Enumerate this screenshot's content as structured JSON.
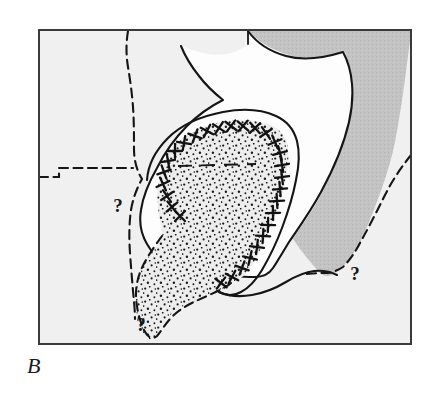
{
  "figure": {
    "panel_label": "B",
    "type": "geologic-sketch-map",
    "canvas": {
      "width": 439,
      "height": 400
    }
  },
  "frame": {
    "x": 38,
    "y": 29,
    "width": 374,
    "height": 316,
    "border_color": "#3a3a3a",
    "border_width": 2
  },
  "colors": {
    "page_background": "#ffffff",
    "map_background": "#f0f0f0",
    "craton_fill": "#fdfdfd",
    "shaded_belt_fill": "#c3c3c3",
    "stipple_inner_fill": "#ededed",
    "stipple_dot_color": "#1c1c1c",
    "line_color": "#151515",
    "label_color": "#1a1a1a"
  },
  "annotations": {
    "question_marks": [
      {
        "id": "qmark-west",
        "label": "?",
        "x": 118,
        "y": 206
      },
      {
        "id": "qmark-east",
        "label": "?",
        "x": 355,
        "y": 274
      },
      {
        "id": "qmark-south",
        "label": "?",
        "x": 141,
        "y": 325
      }
    ]
  },
  "legend_symbols": {
    "cross_chain": "x-symbol-chain",
    "stipple": "stippled-fill",
    "solid_contour": "solid-boundary-line",
    "dashed_contour": "dashed-inferred-boundary",
    "gray_shading": "gray-shaded-zone"
  },
  "geometry": {
    "shaded_zone_outline": "M 248 31 L 411 31 L 411 33 C 405 70 400 110 394 140 C 388 170 376 200 366 225 C 356 250 344 264 334 272 C 330 276 324 276 320 272 C 310 262 300 250 292 238 C 300 225 312 210 322 190 C 334 168 342 145 348 120 C 354 95 352 70 344 52 C 330 56 310 60 292 56 C 272 51 258 42 248 31 Z",
    "craton_outline": "M 248 31 C 256 42 268 51 286 56 C 304 61 326 57 342 52 C 352 70 354 96 348 122 C 342 148 332 170 320 192 C 308 214 296 230 288 242 C 282 252 276 262 272 268 C 268 274 262 277 254 277 C 244 277 234 276 226 276 C 218 276 212 279 206 284 C 198 290 192 292 186 290 C 180 288 174 282 168 274 C 160 264 152 254 146 244 C 140 234 138 222 140 210 C 142 196 148 182 156 168 C 164 152 174 138 186 126 C 198 114 210 106 222 100 C 212 92 204 84 198 76 C 190 66 184 56 180 46 C 186 48 196 52 208 54 C 220 56 234 54 244 46 Z",
    "western_dashed": "M 128 31 C 126 42 126 54 128 66 C 130 78 132 92 133 106 C 134 120 134 134 134 148 C 134 160 136 170 140 178 C 136 186 132 196 130 208 C 128 222 128 238 129 252 C 130 266 131 278 132 290 C 133 300 134 310 134 318",
    "horizontal_dashed": "M 38 176 L 58 176 L 58 168 L 132 168",
    "eastern_dashed": "M 412 156 C 404 166 394 180 386 196 C 378 212 370 228 362 242 C 356 254 350 262 344 268 C 338 272 332 274 326 274 C 318 274 310 274 304 274",
    "cross_chain": "M 160 178 C 160 166 166 154 176 144 C 188 132 204 125 222 122 C 240 119 256 120 268 124 C 276 127 282 132 285 139 C 288 148 288 158 286 170 C 284 184 280 198 275 212 C 270 226 264 240 258 252 C 252 264 246 272 240 277 C 234 281 228 283 222 282 C 216 281 210 278 205 273 C 200 268 196 262 193 256",
    "stipple_upper_outline": "M 160 178 C 160 166 166 154 176 144 C 188 132 204 125 222 122 C 240 119 256 120 268 124 C 276 127 282 132 285 139 C 288 148 288 158 286 170 C 284 184 280 198 275 212 C 270 226 264 240 258 252 C 252 264 246 272 240 277 C 232 282 224 282 216 278 C 208 274 202 268 198 260 C 194 252 192 244 191 236 C 190 228 188 222 184 218 C 180 214 175 214 170 218 C 166 222 163 228 162 234 C 160 226 158 216 157 206 C 156 196 157 186 160 178 Z",
    "stipple_lower_outline": "M 162 236 C 164 228 168 220 174 216 C 180 212 186 213 190 218 C 194 223 196 230 197 238 C 198 248 202 258 208 266 C 214 274 222 280 230 282 C 222 288 212 293 202 297 C 192 301 182 304 174 310 C 166 316 160 324 157 332 C 154 338 150 340 146 337 C 142 334 139 328 137 320 C 135 310 134 298 136 286 C 138 272 144 260 152 250 C 156 244 160 240 162 236 Z"
  }
}
